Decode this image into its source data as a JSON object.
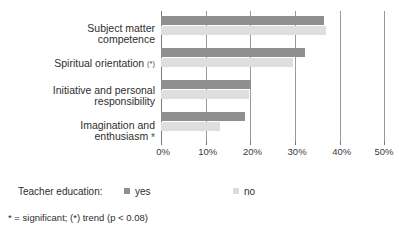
{
  "chart_data": {
    "type": "bar",
    "orientation": "horizontal",
    "title": "",
    "xlabel": "",
    "ylabel": "",
    "xlim": [
      0,
      50
    ],
    "xtick_labels": [
      "0%",
      "10%",
      "20%",
      "30%",
      "40%",
      "50%"
    ],
    "xtick_values": [
      0,
      10,
      20,
      30,
      40,
      50
    ],
    "grid": true,
    "legend_position": "bottom",
    "categories": [
      "Subject matter\ncompetence",
      "Spiritual orientation",
      "Initiative and personal\nresponsibility",
      "Imagination and\nenthusiasm"
    ],
    "category_significance": [
      "",
      "(*)",
      "",
      "*"
    ],
    "series": [
      {
        "name": "yes",
        "color": "#8f8f8f",
        "values": [
          36.5,
          32.3,
          20.2,
          18.8
        ]
      },
      {
        "name": "no",
        "color": "#dedede",
        "values": [
          37.0,
          29.6,
          19.8,
          13.3
        ]
      }
    ]
  },
  "legend": {
    "title": "Teacher education:",
    "entries": [
      {
        "label": "yes"
      },
      {
        "label": "no"
      }
    ]
  },
  "footnote": {
    "text": "* = significant;  (*) trend (p < 0.08)"
  }
}
